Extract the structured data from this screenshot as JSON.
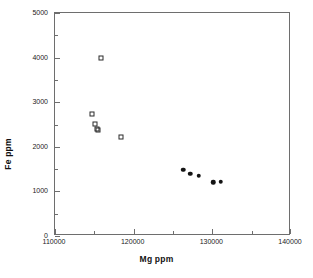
{
  "chart_data": {
    "type": "scatter",
    "title": "",
    "xlabel": "Mg ppm",
    "ylabel": "Fe ppm",
    "xlim": [
      110000,
      140000
    ],
    "ylim": [
      0,
      5000
    ],
    "grid": false,
    "legend": "none",
    "x_ticks_major": [
      110000,
      120000,
      130000,
      140000
    ],
    "x_ticks_major_labels": [
      "110000",
      "120000",
      "130000",
      "140000"
    ],
    "x_ticks_minor": [
      115000,
      125000,
      135000
    ],
    "y_ticks_major": [
      0,
      1000,
      2000,
      3000,
      4000,
      5000
    ],
    "y_ticks_major_labels": [
      "0",
      "1000",
      "2000",
      "3000",
      "4000",
      "5000"
    ],
    "y_ticks_minor": [
      500,
      1500,
      2500,
      3500,
      4500
    ],
    "series": [
      {
        "name": "open-squares",
        "marker": "open-square",
        "color": "#2b2b2b",
        "points": [
          {
            "x": 115900,
            "y": 3990
          },
          {
            "x": 114700,
            "y": 2740
          },
          {
            "x": 115100,
            "y": 2520
          },
          {
            "x": 115400,
            "y": 2400
          },
          {
            "x": 115500,
            "y": 2370
          },
          {
            "x": 118400,
            "y": 2210
          }
        ]
      },
      {
        "name": "filled-circles",
        "marker": "filled-circle",
        "color": "#141414",
        "points": [
          {
            "x": 126300,
            "y": 1480
          },
          {
            "x": 127200,
            "y": 1400
          },
          {
            "x": 128300,
            "y": 1350
          },
          {
            "x": 130100,
            "y": 1200
          },
          {
            "x": 131100,
            "y": 1215
          }
        ]
      }
    ]
  },
  "axes": {
    "x_title": "Mg ppm",
    "y_title": "Fe ppm"
  }
}
